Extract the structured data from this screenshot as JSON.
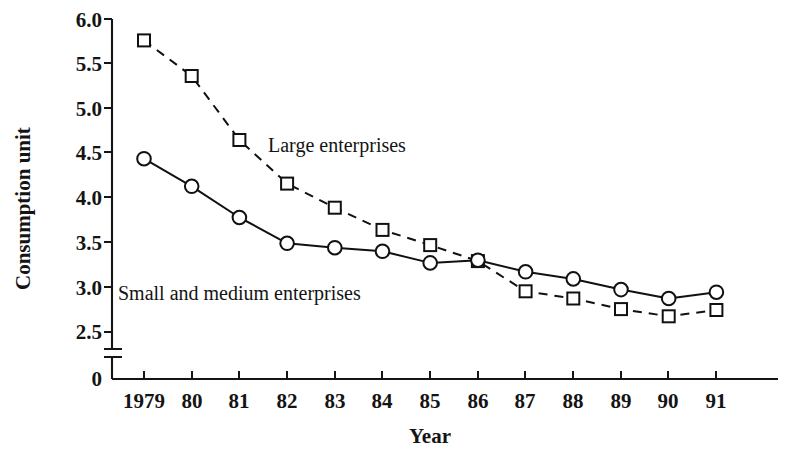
{
  "chart_data": {
    "type": "line",
    "title": "",
    "xlabel": "Year",
    "ylabel": "Consumption unit",
    "categories": [
      "1979",
      "80",
      "81",
      "82",
      "83",
      "84",
      "85",
      "86",
      "87",
      "88",
      "89",
      "90",
      "91"
    ],
    "x_tick_labels": [
      "1979",
      "80",
      "81",
      "82",
      "83",
      "84",
      "85",
      "86",
      "87",
      "88",
      "89",
      "90",
      "91"
    ],
    "y_tick_labels": [
      "0",
      "2.5",
      "3.0",
      "3.5",
      "4.0",
      "4.5",
      "5.0",
      "5.5",
      "6.0"
    ],
    "y_tick_values": [
      0,
      2.5,
      3.0,
      3.5,
      4.0,
      4.5,
      5.0,
      5.5,
      6.0
    ],
    "ylim": [
      2.5,
      6.0
    ],
    "axis_break": true,
    "axis_break_note": "y-axis broken between 0 and 2.5",
    "grid": false,
    "legend_position": "inline-annotations",
    "series": [
      {
        "name": "Large enterprises",
        "marker": "open-square",
        "linestyle": "dashed",
        "values": [
          5.76,
          5.36,
          4.64,
          4.15,
          3.88,
          3.63,
          3.46,
          3.28,
          2.94,
          2.86,
          2.74,
          2.66,
          2.73
        ]
      },
      {
        "name": "Small and medium enterprises",
        "marker": "open-circle",
        "linestyle": "solid",
        "values": [
          4.43,
          4.12,
          3.77,
          3.48,
          3.43,
          3.39,
          3.26,
          3.29,
          3.16,
          3.08,
          2.96,
          2.86,
          2.93
        ]
      }
    ],
    "annotations": [
      {
        "text": "Large enterprises",
        "series": "Large enterprises"
      },
      {
        "text": "Small and medium enterprises",
        "series": "Small and medium enterprises"
      }
    ],
    "colors": {
      "ink": "#111111",
      "background": "#ffffff"
    }
  }
}
